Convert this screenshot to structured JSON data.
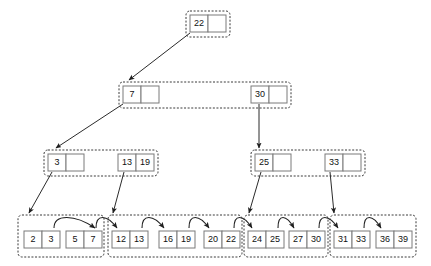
{
  "diagram": {
    "type": "b-plus-tree",
    "background_color": "#ffffff",
    "node_border_color": "#7a7a7a",
    "group_border_color": "#3a3a3a",
    "arrow_color": "#2b2b2b",
    "empty_cell_label": ""
  },
  "levels": [
    {
      "name": "root-level",
      "groups": [
        {
          "name": "root-group",
          "x": 186,
          "y": 11,
          "w": 44,
          "h": 26,
          "nodes": [
            {
              "name": "root-node",
              "x": 190,
              "y": 15,
              "w": 36,
              "h": 17,
              "cells": [
                {
                  "label": "22",
                  "filled": true
                },
                {
                  "label": "",
                  "filled": false
                }
              ]
            }
          ]
        }
      ]
    },
    {
      "name": "internal-level-1",
      "groups": [
        {
          "name": "internal-group-1",
          "x": 119,
          "y": 82,
          "w": 172,
          "h": 26,
          "nodes": [
            {
              "name": "node-7",
              "x": 123,
              "y": 86,
              "w": 36,
              "h": 17,
              "cells": [
                {
                  "label": "7",
                  "filled": true
                },
                {
                  "label": "",
                  "filled": false
                }
              ]
            },
            {
              "name": "node-30",
              "x": 251,
              "y": 86,
              "w": 36,
              "h": 17,
              "cells": [
                {
                  "label": "30",
                  "filled": true
                },
                {
                  "label": "",
                  "filled": false
                }
              ]
            }
          ]
        }
      ]
    },
    {
      "name": "internal-level-2",
      "groups": [
        {
          "name": "internal-group-2-left",
          "x": 44,
          "y": 150,
          "w": 114,
          "h": 26,
          "nodes": [
            {
              "name": "node-3",
              "x": 48,
              "y": 154,
              "w": 36,
              "h": 17,
              "cells": [
                {
                  "label": "3",
                  "filled": true
                },
                {
                  "label": "",
                  "filled": false
                }
              ]
            },
            {
              "name": "node-13-19",
              "x": 118,
              "y": 154,
              "w": 36,
              "h": 17,
              "cells": [
                {
                  "label": "13",
                  "filled": true
                },
                {
                  "label": "19",
                  "filled": true
                }
              ]
            }
          ]
        },
        {
          "name": "internal-group-2-right",
          "x": 251,
          "y": 150,
          "w": 114,
          "h": 26,
          "nodes": [
            {
              "name": "node-25",
              "x": 255,
              "y": 154,
              "w": 36,
              "h": 17,
              "cells": [
                {
                  "label": "25",
                  "filled": true
                },
                {
                  "label": "",
                  "filled": false
                }
              ]
            },
            {
              "name": "node-33",
              "x": 325,
              "y": 154,
              "w": 36,
              "h": 17,
              "cells": [
                {
                  "label": "33",
                  "filled": true
                },
                {
                  "label": "",
                  "filled": false
                }
              ]
            }
          ]
        }
      ]
    },
    {
      "name": "leaf-level",
      "groups": [
        {
          "name": "leaf-group-1",
          "x": 18,
          "y": 215,
          "w": 86,
          "h": 42,
          "nodes": [
            {
              "name": "leaf-2-3",
              "x": 24,
              "y": 231,
              "w": 36,
              "h": 17,
              "cells": [
                {
                  "label": "2",
                  "filled": true
                },
                {
                  "label": "3",
                  "filled": true
                }
              ]
            },
            {
              "name": "leaf-5-7",
              "x": 66,
              "y": 231,
              "w": 36,
              "h": 17,
              "cells": [
                {
                  "label": "5",
                  "filled": true
                },
                {
                  "label": "7",
                  "filled": true
                }
              ]
            }
          ]
        },
        {
          "name": "leaf-group-2",
          "x": 108,
          "y": 215,
          "w": 134,
          "h": 42,
          "nodes": [
            {
              "name": "leaf-12-13",
              "x": 112,
              "y": 231,
              "w": 36,
              "h": 17,
              "cells": [
                {
                  "label": "12",
                  "filled": true
                },
                {
                  "label": "13",
                  "filled": true
                }
              ]
            },
            {
              "name": "leaf-16-19",
              "x": 159,
              "y": 231,
              "w": 36,
              "h": 17,
              "cells": [
                {
                  "label": "16",
                  "filled": true
                },
                {
                  "label": "19",
                  "filled": true
                }
              ]
            },
            {
              "name": "leaf-20-22",
              "x": 204,
              "y": 231,
              "w": 36,
              "h": 17,
              "cells": [
                {
                  "label": "20",
                  "filled": true
                },
                {
                  "label": "22",
                  "filled": true
                }
              ]
            }
          ]
        },
        {
          "name": "leaf-group-3",
          "x": 244,
          "y": 215,
          "w": 84,
          "h": 42,
          "nodes": [
            {
              "name": "leaf-24-25",
              "x": 248,
              "y": 231,
              "w": 36,
              "h": 17,
              "cells": [
                {
                  "label": "24",
                  "filled": true
                },
                {
                  "label": "25",
                  "filled": true
                }
              ]
            },
            {
              "name": "leaf-27-30",
              "x": 289,
              "y": 231,
              "w": 36,
              "h": 17,
              "cells": [
                {
                  "label": "27",
                  "filled": true
                },
                {
                  "label": "30",
                  "filled": true
                }
              ]
            }
          ]
        },
        {
          "name": "leaf-group-4",
          "x": 330,
          "y": 215,
          "w": 86,
          "h": 42,
          "nodes": [
            {
              "name": "leaf-31-33",
              "x": 334,
              "y": 231,
              "w": 36,
              "h": 17,
              "cells": [
                {
                  "label": "31",
                  "filled": true
                },
                {
                  "label": "33",
                  "filled": true
                }
              ]
            },
            {
              "name": "leaf-36-39",
              "x": 376,
              "y": 231,
              "w": 36,
              "h": 17,
              "cells": [
                {
                  "label": "36",
                  "filled": true
                },
                {
                  "label": "39",
                  "filled": true
                }
              ]
            }
          ]
        }
      ]
    }
  ],
  "child_pointers": [
    {
      "name": "pointer-root-to-7",
      "from": "root-node",
      "to": "node-7",
      "x1": 190,
      "y1": 33,
      "x2": 129,
      "y2": 80
    },
    {
      "name": "pointer-30-to-25",
      "from": "node-30",
      "to": "node-25",
      "x1": 259,
      "y1": 104,
      "x2": 259,
      "y2": 148
    },
    {
      "name": "pointer-7-to-3",
      "from": "node-7",
      "to": "node-3",
      "x1": 123,
      "y1": 104,
      "x2": 56,
      "y2": 148
    },
    {
      "name": "pointer-3-to-leaf1",
      "from": "node-3",
      "to": "leaf-group-1",
      "x1": 52,
      "y1": 172,
      "x2": 29,
      "y2": 213
    },
    {
      "name": "pointer-13-to-leaf2",
      "from": "node-13-19",
      "to": "leaf-group-2",
      "x1": 124,
      "y1": 172,
      "x2": 113,
      "y2": 213
    },
    {
      "name": "pointer-25-to-leaf3",
      "from": "node-25",
      "to": "leaf-group-3",
      "x1": 261,
      "y1": 172,
      "x2": 249,
      "y2": 213
    },
    {
      "name": "pointer-33-to-leaf4",
      "from": "node-33",
      "to": "leaf-group-4",
      "x1": 330,
      "y1": 172,
      "x2": 334,
      "y2": 213
    }
  ],
  "leaf_chain": [
    {
      "name": "chain-2-3-to-5-7",
      "from": "leaf-2-3",
      "to": "leaf-5-7",
      "x1": 54,
      "x2": 95,
      "y": 228,
      "lift": 14
    },
    {
      "name": "chain-5-7-to-12-13",
      "from": "leaf-5-7",
      "to": "leaf-12-13",
      "x1": 96,
      "x2": 117,
      "y": 228,
      "lift": 14
    },
    {
      "name": "chain-12-13-to-16-19",
      "from": "leaf-12-13",
      "to": "leaf-16-19",
      "x1": 142,
      "x2": 164,
      "y": 228,
      "lift": 14
    },
    {
      "name": "chain-16-19-to-20-22",
      "from": "leaf-16-19",
      "to": "leaf-20-22",
      "x1": 189,
      "x2": 209,
      "y": 228,
      "lift": 14
    },
    {
      "name": "chain-20-22-to-24-25",
      "from": "leaf-20-22",
      "to": "leaf-24-25",
      "x1": 234,
      "x2": 252,
      "y": 228,
      "lift": 14
    },
    {
      "name": "chain-24-25-to-27-30",
      "from": "leaf-24-25",
      "to": "leaf-27-30",
      "x1": 278,
      "x2": 294,
      "y": 228,
      "lift": 14
    },
    {
      "name": "chain-27-30-to-31-33",
      "from": "leaf-27-30",
      "to": "leaf-31-33",
      "x1": 319,
      "x2": 338,
      "y": 228,
      "lift": 14
    },
    {
      "name": "chain-31-33-to-36-39",
      "from": "leaf-31-33",
      "to": "leaf-36-39",
      "x1": 364,
      "x2": 381,
      "y": 228,
      "lift": 14
    }
  ]
}
